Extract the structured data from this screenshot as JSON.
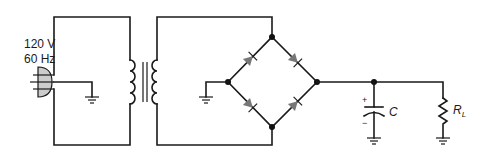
{
  "diagram": {
    "type": "full-wave bridge rectifier with capacitor filter",
    "source": {
      "voltage_label": "120 V",
      "frequency_label": "60 Hz"
    },
    "capacitor": {
      "label": "C",
      "plus_label": "+",
      "minus_label": "−"
    },
    "load": {
      "label": "R",
      "subscript": "L"
    },
    "colors": {
      "wire": "#1a1a1a",
      "diode": "#777777",
      "plug": "#cccccc"
    }
  }
}
